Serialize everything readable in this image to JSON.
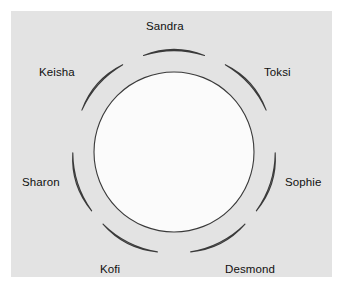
{
  "diagram": {
    "table": {
      "shape": "circle",
      "center_x": 174,
      "center_y": 152,
      "radius": 80,
      "fill": "#fbfbfb",
      "stroke": "#3a3a3a"
    },
    "panel": {
      "background": "#e3e3e3",
      "page_background": "#ffffff"
    },
    "seat_style": {
      "fill": "#bdbdbd",
      "stroke": "#3a3a3a",
      "shape": "crescent"
    },
    "seats": [
      {
        "name": "Sandra",
        "angle_deg": 270,
        "label": "Sandra"
      },
      {
        "name": "Toksi",
        "angle_deg": 318,
        "label": "Toksi"
      },
      {
        "name": "Sophie",
        "angle_deg": 18,
        "label": "Sophie"
      },
      {
        "name": "Desmond",
        "angle_deg": 63,
        "label": "Desmond"
      },
      {
        "name": "Kofi",
        "angle_deg": 117,
        "label": "Kofi"
      },
      {
        "name": "Sharon",
        "angle_deg": 162,
        "label": "Sharon"
      },
      {
        "name": "Keisha",
        "angle_deg": 222,
        "label": "Keisha"
      }
    ],
    "seat_count": 7
  }
}
